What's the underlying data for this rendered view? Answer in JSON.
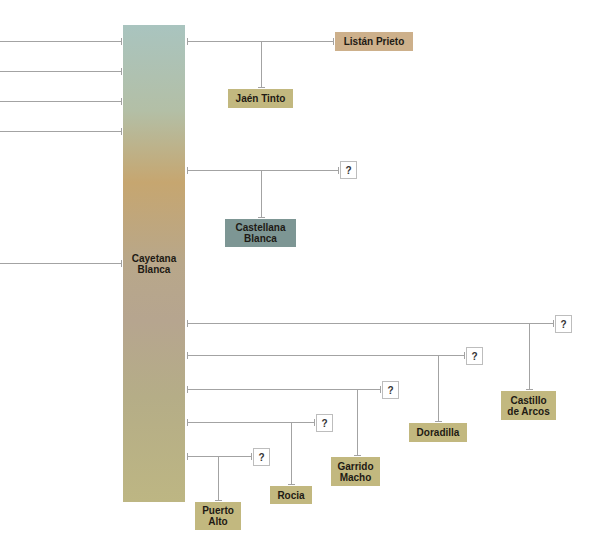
{
  "diagram": {
    "central": {
      "label": "Cayetana Blanca"
    },
    "left_inputs_count": 5,
    "unknown_label": "?",
    "colors": {
      "line": "#9a9a9a",
      "khaki": "#c2b87f",
      "tan": "#cdb08b",
      "slate": "#7d9694"
    },
    "branches": [
      {
        "unknown_parent": "Listán Prieto",
        "child": "Jaén Tinto"
      },
      {
        "unknown_parent": "?",
        "child": "Castellana Blanca"
      },
      {
        "unknown_parent": "?",
        "child": "Castillo de Arcos"
      },
      {
        "unknown_parent": "?",
        "child": "Doradilla"
      },
      {
        "unknown_parent": "?",
        "child": "Garrido Macho"
      },
      {
        "unknown_parent": "?",
        "child": "Rocia"
      },
      {
        "unknown_parent": "?",
        "child": "Puerto Alto"
      }
    ],
    "nodes": {
      "listan_prieto": "Listán Prieto",
      "jaen_tinto": "Jaén Tinto",
      "castellana_blanca_1": "Castellana",
      "castellana_blanca_2": "Blanca",
      "castillo_1": "Castillo",
      "castillo_2": "de Arcos",
      "doradilla": "Doradilla",
      "garrido_1": "Garrido",
      "garrido_2": "Macho",
      "rocia": "Rocia",
      "puerto_1": "Puerto",
      "puerto_2": "Alto",
      "cayetana_1": "Cayetana",
      "cayetana_2": "Blanca"
    }
  }
}
